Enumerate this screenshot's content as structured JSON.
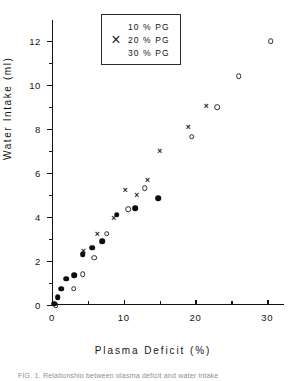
{
  "chart_data": {
    "type": "scatter",
    "title": "",
    "xlabel": "Plasma Deficit (%)",
    "ylabel": "Water Intake (ml)",
    "xlim": [
      0,
      31.5
    ],
    "ylim": [
      0,
      12.6
    ],
    "grid": false,
    "legend_position": "top-center",
    "x_ticks_major": [
      0,
      10,
      20,
      30
    ],
    "x_ticks_minor": [
      5,
      15,
      25
    ],
    "y_ticks_major": [
      0,
      2,
      4,
      6,
      8,
      10,
      12
    ],
    "y_ticks_minor": [
      1,
      3,
      5,
      7,
      9,
      11
    ],
    "series": [
      {
        "name": "10 % PG",
        "marker": "filled-circle",
        "points": [
          {
            "x": 0.3,
            "y": 0.05
          },
          {
            "x": 0.8,
            "y": 0.35
          },
          {
            "x": 1.3,
            "y": 0.75
          },
          {
            "x": 2.0,
            "y": 1.2
          },
          {
            "x": 3.1,
            "y": 1.35
          },
          {
            "x": 4.3,
            "y": 2.3
          },
          {
            "x": 5.6,
            "y": 2.6
          },
          {
            "x": 7.0,
            "y": 2.9
          },
          {
            "x": 9.0,
            "y": 4.1
          },
          {
            "x": 11.6,
            "y": 4.4
          },
          {
            "x": 14.8,
            "y": 4.85
          }
        ]
      },
      {
        "name": "20 % PG",
        "marker": "cross",
        "points": [
          {
            "x": 4.4,
            "y": 2.45
          },
          {
            "x": 6.3,
            "y": 3.25
          },
          {
            "x": 8.6,
            "y": 3.95
          },
          {
            "x": 10.2,
            "y": 5.25
          },
          {
            "x": 11.8,
            "y": 5.0
          },
          {
            "x": 13.3,
            "y": 5.7
          },
          {
            "x": 15.0,
            "y": 7.0
          },
          {
            "x": 19.0,
            "y": 8.1
          },
          {
            "x": 21.5,
            "y": 9.05
          }
        ]
      },
      {
        "name": "30 % PG",
        "marker": "open-circle",
        "points": [
          {
            "x": 0.5,
            "y": 0.0
          },
          {
            "x": 3.0,
            "y": 0.75
          },
          {
            "x": 4.3,
            "y": 1.4
          },
          {
            "x": 5.9,
            "y": 2.15
          },
          {
            "x": 7.6,
            "y": 3.25
          },
          {
            "x": 10.6,
            "y": 4.35
          },
          {
            "x": 12.9,
            "y": 5.3
          },
          {
            "x": 19.5,
            "y": 7.65
          },
          {
            "x": 23.0,
            "y": 9.0
          },
          {
            "x": 26.0,
            "y": 10.4
          },
          {
            "x": 30.5,
            "y": 12.0
          }
        ]
      }
    ]
  },
  "legend": {
    "items": [
      {
        "label": "10 % PG",
        "marker": "filled-circle"
      },
      {
        "label": "20 % PG",
        "marker": "cross"
      },
      {
        "label": "30 % PG",
        "marker": "open-circle"
      }
    ]
  },
  "cross_glyph": "×",
  "caption_fragment": "FIG. 1. Relationship between plasma deficit and water intake"
}
